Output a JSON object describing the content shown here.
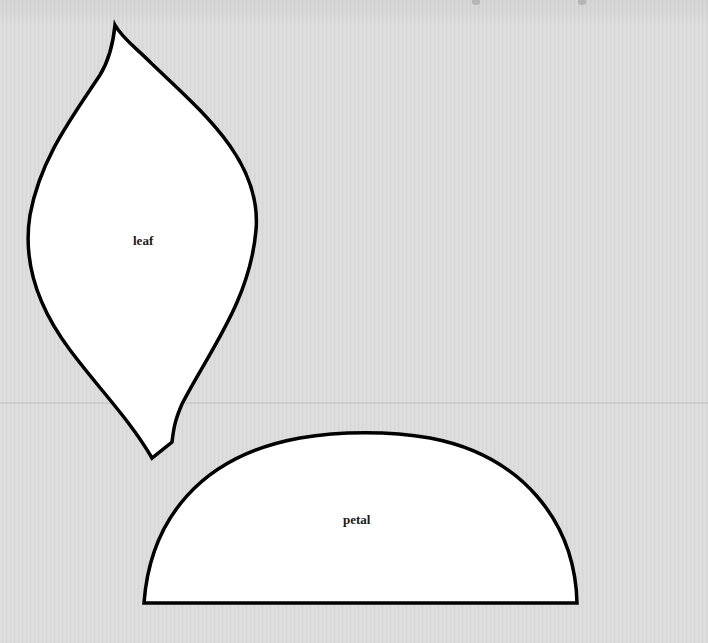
{
  "template": {
    "shapes": [
      {
        "id": "leaf",
        "label": "leaf"
      },
      {
        "id": "petal",
        "label": "petal"
      }
    ],
    "colors": {
      "background": "#dddddd",
      "shape_fill": "#ffffff",
      "outline": "#000000",
      "label": "#1a1a1a"
    }
  }
}
